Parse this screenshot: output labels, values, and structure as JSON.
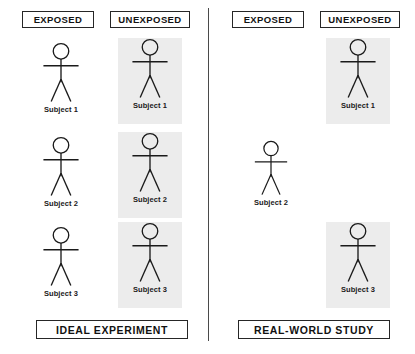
{
  "diagram": {
    "title_visible": false,
    "background_color": "#ffffff",
    "stroke_color": "#1a1a1a",
    "shade_color": "#ececec",
    "divider": {
      "x": 208,
      "y": 8,
      "height": 333
    },
    "panels": [
      {
        "id": "ideal-experiment",
        "caption": "IDEAL EXPERIMENT",
        "caption_box": {
          "x": 36,
          "y": 320,
          "width": 152
        },
        "columns": [
          {
            "id": "exposed",
            "header": "EXPOSED",
            "header_box": {
              "x": 22,
              "y": 11,
              "width": 72
            },
            "shaded": false,
            "subjects": [
              {
                "label": "Subject 1",
                "present": true,
                "x": 30,
                "y": 42,
                "width": 62,
                "height": 80,
                "scale": 1.0
              },
              {
                "label": "Subject 2",
                "present": true,
                "x": 30,
                "y": 136,
                "width": 62,
                "height": 80,
                "scale": 1.0
              },
              {
                "label": "Subject 3",
                "present": true,
                "x": 30,
                "y": 226,
                "width": 62,
                "height": 80,
                "scale": 1.0
              }
            ]
          },
          {
            "id": "unexposed",
            "header": "UNEXPOSED",
            "header_box": {
              "x": 110,
              "y": 11,
              "width": 80
            },
            "shaded": true,
            "subjects": [
              {
                "label": "Subject 1",
                "present": true,
                "x": 118,
                "y": 38,
                "width": 64,
                "height": 86,
                "scale": 1.0
              },
              {
                "label": "Subject 2",
                "present": true,
                "x": 118,
                "y": 132,
                "width": 64,
                "height": 86,
                "scale": 1.0
              },
              {
                "label": "Subject 3",
                "present": true,
                "x": 118,
                "y": 222,
                "width": 64,
                "height": 86,
                "scale": 1.0
              }
            ]
          }
        ]
      },
      {
        "id": "real-world-study",
        "caption": "REAL-WORLD STUDY",
        "caption_box": {
          "x": 238,
          "y": 320,
          "width": 152
        },
        "columns": [
          {
            "id": "exposed",
            "header": "EXPOSED",
            "header_box": {
              "x": 232,
              "y": 11,
              "width": 72
            },
            "shaded": false,
            "subjects": [
              {
                "label": "",
                "present": false,
                "x": 240,
                "y": 42,
                "width": 62,
                "height": 80,
                "scale": 1.0
              },
              {
                "label": "Subject 2",
                "present": true,
                "x": 243,
                "y": 140,
                "width": 56,
                "height": 74,
                "scale": 0.92
              },
              {
                "label": "",
                "present": false,
                "x": 240,
                "y": 226,
                "width": 62,
                "height": 80,
                "scale": 1.0
              }
            ]
          },
          {
            "id": "unexposed",
            "header": "UNEXPOSED",
            "header_box": {
              "x": 320,
              "y": 11,
              "width": 80
            },
            "shaded": true,
            "subjects": [
              {
                "label": "Subject 1",
                "present": true,
                "x": 326,
                "y": 38,
                "width": 64,
                "height": 86,
                "scale": 1.0
              },
              {
                "label": "",
                "present": false,
                "x": 326,
                "y": 132,
                "width": 64,
                "height": 86,
                "scale": 1.0
              },
              {
                "label": "Subject 3",
                "present": true,
                "x": 326,
                "y": 222,
                "width": 64,
                "height": 86,
                "scale": 1.0
              }
            ]
          }
        ]
      }
    ]
  }
}
